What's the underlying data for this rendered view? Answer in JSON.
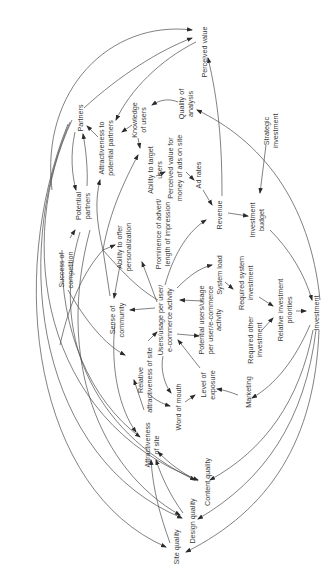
{
  "diagram": {
    "type": "causal-loop-diagram",
    "orientation": "rotated-90-ccw",
    "colors": {
      "line": "#4a4a4a",
      "text": "#3a3a3a",
      "background": "#ffffff"
    },
    "nodes": [
      {
        "id": "perceived_value",
        "lines": [
          "Perceived value"
        ],
        "x": 204,
        "y": 52
      },
      {
        "id": "partners",
        "lines": [
          "Partners"
        ],
        "x": 80,
        "y": 118
      },
      {
        "id": "attractiveness_partners",
        "lines": [
          "Attractiveness to",
          "potential partners"
        ],
        "x": 106,
        "y": 148
      },
      {
        "id": "knowledge_users",
        "lines": [
          "Knowledge",
          "of users"
        ],
        "x": 139,
        "y": 120
      },
      {
        "id": "quality_analysis",
        "lines": [
          "Quality of",
          "analysis"
        ],
        "x": 186,
        "y": 104
      },
      {
        "id": "strategic_investment",
        "lines": [
          "Strategic",
          "investment"
        ],
        "x": 271,
        "y": 131
      },
      {
        "id": "potential_partners",
        "lines": [
          "Potential",
          "partners"
        ],
        "x": 83,
        "y": 206
      },
      {
        "id": "ability_target",
        "lines": [
          "Ability to target",
          "users"
        ],
        "x": 155,
        "y": 170
      },
      {
        "id": "perceived_value_ads",
        "lines": [
          "Perceived value for",
          "money of ads on site"
        ],
        "x": 175,
        "y": 168
      },
      {
        "id": "ad_rates",
        "lines": [
          "Ad rates"
        ],
        "x": 198,
        "y": 175
      },
      {
        "id": "success_competition",
        "lines": [
          "Success of",
          "competition"
        ],
        "x": 66,
        "y": 270
      },
      {
        "id": "ability_personalization",
        "lines": [
          "Ability to offer",
          "personalization"
        ],
        "x": 124,
        "y": 247
      },
      {
        "id": "prominence_advert",
        "lines": [
          "Prominence of advert/",
          "length of impression"
        ],
        "x": 163,
        "y": 234
      },
      {
        "id": "revenue",
        "lines": [
          "Revenue"
        ],
        "x": 219,
        "y": 215
      },
      {
        "id": "investment_budget",
        "lines": [
          "Investment",
          "budget"
        ],
        "x": 257,
        "y": 220
      },
      {
        "id": "sense_community",
        "lines": [
          "Sense of",
          "community"
        ],
        "x": 117,
        "y": 320
      },
      {
        "id": "users_usage",
        "lines": [
          "Users/usage per user/",
          "e-commerce activity"
        ],
        "x": 165,
        "y": 320
      },
      {
        "id": "system_load",
        "lines": [
          "System load"
        ],
        "x": 219,
        "y": 275
      },
      {
        "id": "required_system_investment",
        "lines": [
          "Required system",
          "investment"
        ],
        "x": 246,
        "y": 283
      },
      {
        "id": "potential_users",
        "lines": [
          "Potential users/usage",
          "per user/e-commerce",
          "activity"
        ],
        "x": 210,
        "y": 320
      },
      {
        "id": "relative_attractiveness",
        "lines": [
          "Relative",
          "attractiveness of site"
        ],
        "x": 145,
        "y": 380
      },
      {
        "id": "relative_investment_priorities",
        "lines": [
          "Relative investment",
          "priorities"
        ],
        "x": 285,
        "y": 310
      },
      {
        "id": "required_other_investment",
        "lines": [
          "Required other",
          "investment"
        ],
        "x": 255,
        "y": 340
      },
      {
        "id": "investment",
        "lines": [
          "Investment"
        ],
        "x": 316,
        "y": 313
      },
      {
        "id": "word_of_mouth",
        "lines": [
          "Word of mouth"
        ],
        "x": 178,
        "y": 407
      },
      {
        "id": "level_exposure",
        "lines": [
          "Level of",
          "exposure"
        ],
        "x": 208,
        "y": 385
      },
      {
        "id": "marketing",
        "lines": [
          "Marketing"
        ],
        "x": 248,
        "y": 392
      },
      {
        "id": "attractiveness_site",
        "lines": [
          "Attractiveness",
          "of site"
        ],
        "x": 152,
        "y": 445
      },
      {
        "id": "content_quality",
        "lines": [
          "Content quality"
        ],
        "x": 207,
        "y": 482
      },
      {
        "id": "design_quality",
        "lines": [
          "Design quality"
        ],
        "x": 192,
        "y": 521
      },
      {
        "id": "site_quality",
        "lines": [
          "Site quality"
        ],
        "x": 176,
        "y": 547
      }
    ],
    "edges": [
      {
        "from": "partners",
        "to": "perceived_value"
      },
      {
        "from": "partners",
        "to": "potential_partners"
      },
      {
        "from": "potential_partners",
        "to": "partners"
      },
      {
        "from": "attractiveness_partners",
        "to": "partners"
      },
      {
        "from": "knowledge_users",
        "to": "attractiveness_partners"
      },
      {
        "from": "quality_analysis",
        "to": "knowledge_users"
      },
      {
        "from": "perceived_value",
        "to": "attractiveness_partners"
      },
      {
        "from": "knowledge_users",
        "to": "ability_target"
      },
      {
        "from": "ability_target",
        "to": "perceived_value_ads"
      },
      {
        "from": "perceived_value_ads",
        "to": "ad_rates"
      },
      {
        "from": "ad_rates",
        "to": "revenue"
      },
      {
        "from": "revenue",
        "to": "investment_budget"
      },
      {
        "from": "revenue",
        "to": "perceived_value"
      },
      {
        "from": "strategic_investment",
        "to": "investment_budget"
      },
      {
        "from": "investment_budget",
        "to": "investment"
      },
      {
        "from": "investment",
        "to": "quality_analysis"
      },
      {
        "from": "success_competition",
        "to": "potential_partners"
      },
      {
        "from": "success_competition",
        "to": "relative_attractiveness"
      },
      {
        "from": "ability_personalization",
        "to": "sense_community"
      },
      {
        "from": "users_usage",
        "to": "prominence_advert"
      },
      {
        "from": "users_usage",
        "to": "sense_community"
      },
      {
        "from": "users_usage",
        "to": "revenue"
      },
      {
        "from": "users_usage",
        "to": "system_load"
      },
      {
        "from": "system_load",
        "to": "required_system_investment"
      },
      {
        "from": "required_system_investment",
        "to": "relative_investment_priorities"
      },
      {
        "from": "required_other_investment",
        "to": "relative_investment_priorities"
      },
      {
        "from": "relative_investment_priorities",
        "to": "investment"
      },
      {
        "from": "potential_users",
        "to": "users_usage"
      },
      {
        "from": "level_exposure",
        "to": "users_usage"
      },
      {
        "from": "relative_attractiveness",
        "to": "users_usage"
      },
      {
        "from": "users_usage",
        "to": "word_of_mouth"
      },
      {
        "from": "word_of_mouth",
        "to": "level_exposure"
      },
      {
        "from": "marketing",
        "to": "level_exposure"
      },
      {
        "from": "investment",
        "to": "marketing"
      },
      {
        "from": "investment",
        "to": "content_quality"
      },
      {
        "from": "investment",
        "to": "design_quality"
      },
      {
        "from": "investment",
        "to": "site_quality"
      },
      {
        "from": "attractiveness_site",
        "to": "relative_attractiveness"
      },
      {
        "from": "content_quality",
        "to": "attractiveness_site"
      },
      {
        "from": "design_quality",
        "to": "attractiveness_site"
      },
      {
        "from": "site_quality",
        "to": "attractiveness_site"
      },
      {
        "from": "sense_community",
        "to": "attractiveness_site"
      },
      {
        "from": "partners",
        "to": "content_quality"
      },
      {
        "from": "partners",
        "to": "design_quality"
      },
      {
        "from": "partners",
        "to": "site_quality"
      }
    ]
  }
}
